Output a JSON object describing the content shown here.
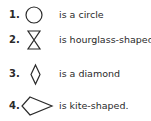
{
  "items": [
    {
      "number": "1.",
      "shape": "circle",
      "label": "is a circle"
    },
    {
      "number": "2.",
      "shape": "hourglass",
      "label": "is hourglass-shaped"
    },
    {
      "number": "3.",
      "shape": "diamond",
      "label": "is a diamond"
    },
    {
      "number": "4.",
      "shape": "kite",
      "label": "is kite-shaped."
    }
  ]
}
